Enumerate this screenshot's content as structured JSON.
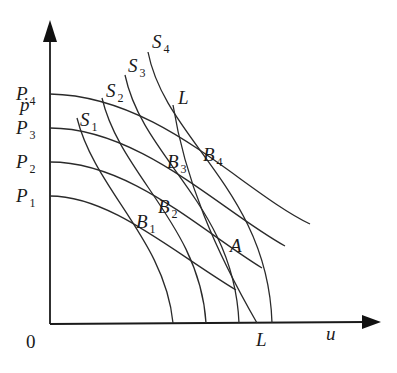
{
  "diagram": {
    "axes": {
      "y_label": "ṗ",
      "x_label": "u",
      "origin_label": "0"
    },
    "y_ticks": [
      {
        "name": "P",
        "sub": "4"
      },
      {
        "name": "P",
        "sub": "3"
      },
      {
        "name": "P",
        "sub": "2"
      },
      {
        "name": "P",
        "sub": "1"
      }
    ],
    "s_curves": [
      {
        "name": "S",
        "sub": "1"
      },
      {
        "name": "S",
        "sub": "2"
      },
      {
        "name": "S",
        "sub": "3"
      },
      {
        "name": "S",
        "sub": "4"
      }
    ],
    "l_line": {
      "top_label": "L",
      "bottom_label": "L"
    },
    "points": [
      {
        "name": "B",
        "sub": "1"
      },
      {
        "name": "B",
        "sub": "2"
      },
      {
        "name": "B",
        "sub": "3"
      },
      {
        "name": "B",
        "sub": "4"
      },
      {
        "name": "A",
        "sub": ""
      }
    ]
  }
}
